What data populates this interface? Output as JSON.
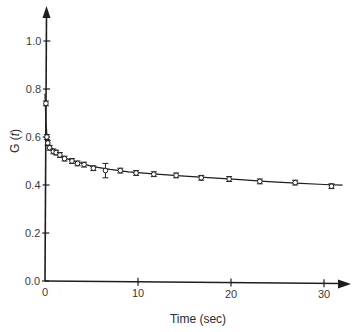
{
  "chart_data": {
    "type": "scatter",
    "title": "",
    "xlabel": "Time (sec)",
    "ylabel": "G (t)",
    "ylabel_parts": {
      "prefix": "G (",
      "var": "t",
      "suffix": ")"
    },
    "xlim": [
      0,
      31
    ],
    "ylim": [
      0.0,
      1.1
    ],
    "x_ticks": [
      0,
      10,
      20,
      30
    ],
    "x_tick_labels": [
      "0",
      "10",
      "20",
      "30"
    ],
    "y_ticks": [
      0.0,
      0.2,
      0.4,
      0.6,
      0.8,
      1.0
    ],
    "y_tick_labels": [
      "0.0",
      "0.2",
      "0.4",
      "0.6",
      "0.8",
      "1.0"
    ],
    "grid": false,
    "legend": null,
    "marker": "open-circle-with-errorbars",
    "series": [
      {
        "name": "measured",
        "x": [
          0.1,
          0.2,
          0.3,
          0.5,
          0.9,
          1.2,
          1.6,
          2.1,
          2.9,
          3.5,
          4.2,
          5.2,
          6.5,
          8.1,
          9.8,
          11.7,
          14.1,
          16.8,
          19.8,
          23.1,
          26.9,
          30.8
        ],
        "y": [
          0.74,
          0.6,
          0.575,
          0.555,
          0.54,
          0.535,
          0.525,
          0.51,
          0.5,
          0.49,
          0.485,
          0.47,
          0.46,
          0.46,
          0.45,
          0.445,
          0.44,
          0.43,
          0.425,
          0.415,
          0.41,
          0.395
        ],
        "err": [
          0.01,
          0.01,
          0.01,
          0.01,
          0.01,
          0.01,
          0.01,
          0.01,
          0.01,
          0.01,
          0.01,
          0.01,
          0.03,
          0.01,
          0.01,
          0.01,
          0.01,
          0.01,
          0.01,
          0.01,
          0.01,
          0.01
        ]
      },
      {
        "name": "fit",
        "type": "line",
        "x": [
          0.0,
          0.1,
          0.2,
          0.4,
          0.8,
          1.2,
          2.0,
          3.0,
          4.0,
          5.0,
          7.0,
          9.0,
          12.0,
          15.0,
          18.0,
          21.0,
          24.0,
          27.0,
          30.0,
          32.0
        ],
        "y": [
          0.78,
          0.66,
          0.61,
          0.575,
          0.55,
          0.535,
          0.515,
          0.5,
          0.49,
          0.478,
          0.465,
          0.455,
          0.445,
          0.437,
          0.43,
          0.422,
          0.414,
          0.408,
          0.402,
          0.399
        ]
      }
    ]
  }
}
